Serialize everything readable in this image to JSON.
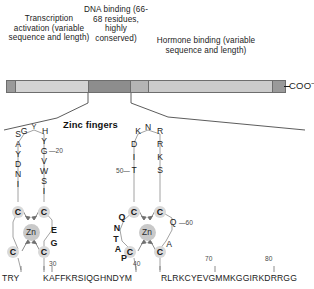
{
  "figure": {
    "coo_terminus": "COO",
    "coo_charge": "–",
    "zinc_fingers_heading": "Zinc fingers"
  },
  "domains": [
    {
      "name": "transcription-activation",
      "caption": "Transcription activation (variable sequence and length)"
    },
    {
      "name": "dna-binding",
      "caption": "DNA binding (66-68 residues, highly conserved)"
    },
    {
      "name": "hormone-binding",
      "caption": "Hormone binding (variable sequence and length)"
    }
  ],
  "bar_segments": [
    {
      "name": "n-terminal-cap",
      "color": "#9a9a9a"
    },
    {
      "name": "activation-region",
      "color": "#d3d3d3"
    },
    {
      "name": "dna-binding-region",
      "color": "#8d8d8d"
    },
    {
      "name": "hinge-region",
      "color": "#b4b4b4"
    },
    {
      "name": "hormone-binding-region",
      "color": "#cbcbcb"
    },
    {
      "name": "c-terminal-cap",
      "color": "#9a9a9a"
    }
  ],
  "zinc_label": "Zn",
  "finger_left": {
    "top_letters": [
      "G",
      "Y",
      "H"
    ],
    "left_column": [
      "S",
      "A",
      "Y",
      "D",
      "N",
      "I"
    ],
    "right_column": [
      "Y",
      "G",
      "V",
      "W",
      "S",
      "I"
    ],
    "cys_label": "C",
    "right_tail": [
      "E",
      "G"
    ],
    "marker_20": "20",
    "marker_30": "30"
  },
  "finger_right": {
    "top_letters": [
      "K",
      "N",
      "R"
    ],
    "left_column": [
      "D",
      "I",
      "T"
    ],
    "right_column": [
      "R",
      "K",
      "S"
    ],
    "cys_label": "C",
    "bold_left": [
      "Q",
      "N",
      "T",
      "A",
      "P"
    ],
    "lower_right": [
      "Q",
      "A"
    ],
    "marker_40": "40",
    "marker_50": "50",
    "marker_60": "60",
    "marker_70": "70",
    "marker_80": "80"
  },
  "sequences": {
    "left_prefix": "TRY",
    "left_main": "KAFFKRSIQGHNDYM",
    "right_main": "RLRKCYEVGMMKGGIRKDRRGG"
  }
}
